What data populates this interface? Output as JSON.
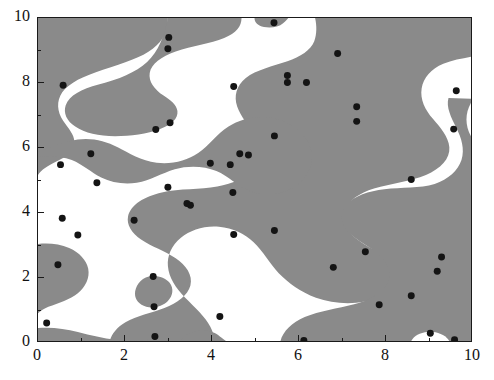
{
  "figure": {
    "type": "scatter-over-binary-field",
    "width": 494,
    "height": 380,
    "background": "#ffffff"
  },
  "colors": {
    "field_gray": "#8a8a8a",
    "field_white": "#ffffff",
    "point_color": "#141414",
    "axis_color": "#1a1a1a",
    "text_color": "#111111"
  },
  "axes": {
    "x": {
      "label": "",
      "min": 0,
      "max": 10,
      "major_ticks": [
        0,
        2,
        4,
        6,
        8,
        10
      ],
      "minor_ticks": [
        1,
        3,
        5,
        7,
        9
      ],
      "tick_labels": [
        "0",
        "2",
        "4",
        "6",
        "8",
        "10"
      ]
    },
    "y": {
      "label": "",
      "min": 0,
      "max": 10,
      "major_ticks": [
        0,
        2,
        4,
        6,
        8,
        10
      ],
      "minor_ticks": [
        1,
        3,
        5,
        7,
        9
      ],
      "tick_labels": [
        "0",
        "2",
        "4",
        "6",
        "8",
        "10"
      ]
    }
  },
  "chart_data": {
    "type": "scatter",
    "title": "",
    "xlabel": "",
    "ylabel": "",
    "xlim": [
      0,
      10
    ],
    "ylim": [
      0,
      10
    ],
    "grid": false,
    "legend": null,
    "marker": {
      "shape": "circle",
      "size_px": 7,
      "color": "#141414"
    },
    "background_field": {
      "description": "binary level-set of a smooth random field; gray = region above threshold, white = region below",
      "gray_color": "#8a8a8a",
      "white_color": "#ffffff"
    },
    "points": [
      [
        5.45,
        9.85
      ],
      [
        3.02,
        9.4
      ],
      [
        3.0,
        9.05
      ],
      [
        6.92,
        8.9
      ],
      [
        5.76,
        8.22
      ],
      [
        5.76,
        8.0
      ],
      [
        6.2,
        8.0
      ],
      [
        0.58,
        7.92
      ],
      [
        4.52,
        7.88
      ],
      [
        9.66,
        7.75
      ],
      [
        7.36,
        7.25
      ],
      [
        7.36,
        6.8
      ],
      [
        3.05,
        6.76
      ],
      [
        2.72,
        6.55
      ],
      [
        9.6,
        6.56
      ],
      [
        5.46,
        6.35
      ],
      [
        1.22,
        5.8
      ],
      [
        4.66,
        5.8
      ],
      [
        4.86,
        5.76
      ],
      [
        3.98,
        5.5
      ],
      [
        4.44,
        5.46
      ],
      [
        0.52,
        5.46
      ],
      [
        8.62,
        5.0
      ],
      [
        1.36,
        4.9
      ],
      [
        3.0,
        4.76
      ],
      [
        4.5,
        4.6
      ],
      [
        3.44,
        4.26
      ],
      [
        3.52,
        4.2
      ],
      [
        0.56,
        3.8
      ],
      [
        2.22,
        3.74
      ],
      [
        5.46,
        3.42
      ],
      [
        4.52,
        3.3
      ],
      [
        0.92,
        3.28
      ],
      [
        7.56,
        2.76
      ],
      [
        9.32,
        2.6
      ],
      [
        0.46,
        2.36
      ],
      [
        6.82,
        2.28
      ],
      [
        9.22,
        2.16
      ],
      [
        2.66,
        2.0
      ],
      [
        8.62,
        1.4
      ],
      [
        7.88,
        1.12
      ],
      [
        2.68,
        1.06
      ],
      [
        4.2,
        0.76
      ],
      [
        0.2,
        0.56
      ],
      [
        9.06,
        0.24
      ],
      [
        2.7,
        0.14
      ],
      [
        6.14,
        0.02
      ],
      [
        9.62,
        0.04
      ]
    ]
  }
}
